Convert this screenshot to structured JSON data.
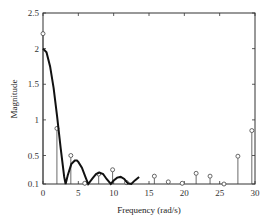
{
  "chart_data": {
    "type": "line",
    "title": "",
    "xlabel": "Frequency (rad/s)",
    "ylabel": "Magnitude",
    "xlim": [
      0,
      30
    ],
    "ylim": [
      0.1,
      2.5
    ],
    "grid": false,
    "legend": null,
    "xticks": [
      0,
      5,
      10,
      15,
      20,
      25,
      30
    ],
    "xtick_labels": [
      "0",
      "5",
      "10",
      "15",
      "20",
      "25",
      "30"
    ],
    "yticks": [
      0.1,
      0.5,
      1,
      1.5,
      2,
      2.5
    ],
    "ytick_labels": [
      "0.1",
      "0.5",
      "1",
      "1.5",
      "2",
      "2.5"
    ],
    "series": [
      {
        "name": "continuous magnitude",
        "type": "line",
        "x": [
          0,
          0.5,
          1,
          1.5,
          2,
          2.5,
          3,
          3.2,
          3.5,
          4,
          4.5,
          4.8,
          5,
          5.5,
          6,
          6.4,
          7,
          7.5,
          8,
          8.5,
          9,
          9.6,
          10,
          10.5,
          11,
          11.5,
          12,
          12.5,
          13,
          13.6
        ],
        "values": [
          2.0,
          1.95,
          1.75,
          1.45,
          1.05,
          0.6,
          0.2,
          0.1,
          0.22,
          0.38,
          0.43,
          0.43,
          0.41,
          0.33,
          0.2,
          0.1,
          0.18,
          0.24,
          0.26,
          0.24,
          0.17,
          0.1,
          0.15,
          0.19,
          0.2,
          0.17,
          0.11,
          0.1,
          0.15,
          0.2
        ]
      },
      {
        "name": "sampled magnitude",
        "type": "stem",
        "x": [
          0,
          2,
          4,
          6,
          8,
          10,
          12,
          16,
          18,
          20,
          22,
          24,
          26,
          28,
          30
        ],
        "values": [
          2.21,
          0.88,
          0.5,
          0.11,
          0.24,
          0.3,
          0.12,
          0.21,
          0.13,
          0.11,
          0.25,
          0.21,
          0.1,
          0.49,
          0.85
        ]
      }
    ]
  }
}
